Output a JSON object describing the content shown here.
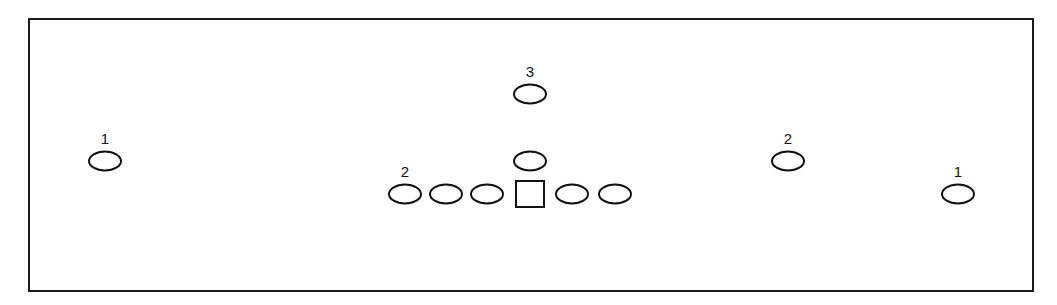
{
  "diagram": {
    "type": "football-formation",
    "border_color": "#1a1a1a",
    "stroke_color": "#111111",
    "players": [
      {
        "id": "left-wide",
        "shape": "ellipse",
        "cx": 105,
        "cy": 161,
        "label": "1"
      },
      {
        "id": "line-left-3",
        "shape": "ellipse",
        "cx": 405,
        "cy": 194,
        "label": "2"
      },
      {
        "id": "line-left-2",
        "shape": "ellipse",
        "cx": 446,
        "cy": 194,
        "label": ""
      },
      {
        "id": "line-left-1",
        "shape": "ellipse",
        "cx": 487,
        "cy": 194,
        "label": ""
      },
      {
        "id": "center",
        "shape": "square",
        "cx": 530,
        "cy": 194,
        "label": ""
      },
      {
        "id": "line-right-1",
        "shape": "ellipse",
        "cx": 572,
        "cy": 194,
        "label": ""
      },
      {
        "id": "line-right-2",
        "shape": "ellipse",
        "cx": 615,
        "cy": 194,
        "label": ""
      },
      {
        "id": "quarterback",
        "shape": "ellipse",
        "cx": 530,
        "cy": 161,
        "label": ""
      },
      {
        "id": "deep-back",
        "shape": "ellipse",
        "cx": 530,
        "cy": 94,
        "label": "3"
      },
      {
        "id": "right-slot",
        "shape": "ellipse",
        "cx": 788,
        "cy": 161,
        "label": "2"
      },
      {
        "id": "right-wide",
        "shape": "ellipse",
        "cx": 958,
        "cy": 194,
        "label": "1"
      }
    ]
  }
}
